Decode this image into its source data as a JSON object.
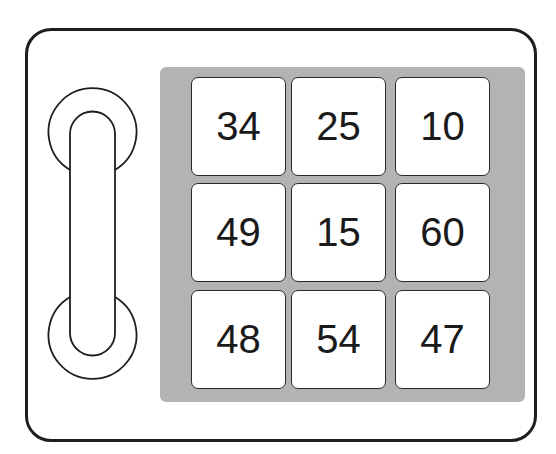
{
  "device": {
    "colors": {
      "outline": "#1e1e1e",
      "keypad_background": "#b3b3b3",
      "key_background": "#ffffff",
      "text": "#1a1a1a"
    }
  },
  "keypad": {
    "rows": [
      [
        "34",
        "25",
        "10"
      ],
      [
        "49",
        "15",
        "60"
      ],
      [
        "48",
        "54",
        "47"
      ]
    ],
    "keys": [
      {
        "label": "34"
      },
      {
        "label": "25"
      },
      {
        "label": "10"
      },
      {
        "label": "49"
      },
      {
        "label": "15"
      },
      {
        "label": "60"
      },
      {
        "label": "48"
      },
      {
        "label": "54"
      },
      {
        "label": "47"
      }
    ]
  }
}
